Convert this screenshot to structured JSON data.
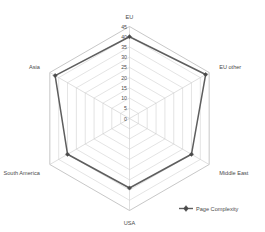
{
  "chart_data": {
    "type": "radar",
    "title": "",
    "categories": [
      "EU",
      "EU other",
      "Middle East",
      "USA",
      "South America",
      "Asia"
    ],
    "series": [
      {
        "name": "Page Complexity",
        "values": [
          40,
          43,
          35,
          34,
          35,
          42
        ],
        "color": "#5e5e5e"
      }
    ],
    "ticks": [
      0,
      5,
      10,
      15,
      20,
      25,
      30,
      35,
      40,
      45
    ],
    "tick_labels": [
      "0",
      "5",
      "10",
      "15",
      "20",
      "25",
      "30",
      "35",
      "40",
      "45"
    ],
    "rlim": [
      0,
      45
    ],
    "grid": true,
    "legend_position": "bottom-right",
    "xlabel": "",
    "ylabel": ""
  },
  "legend": {
    "entries": [
      {
        "label": "Page Complexity",
        "marker": "line-marker",
        "color": "#5e5e5e"
      }
    ]
  },
  "axes": {
    "category_labels": [
      "EU",
      "EU other",
      "Middle East",
      "USA",
      "South America",
      "Asia"
    ],
    "radial_tick_labels": [
      "0",
      "5",
      "10",
      "15",
      "20",
      "25",
      "30",
      "35",
      "40",
      "45"
    ]
  }
}
